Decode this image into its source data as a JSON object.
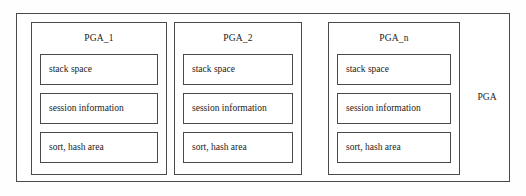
{
  "diagram": {
    "title": "PGA",
    "outer_label": "PGA",
    "panels": [
      {
        "id": "pga-1",
        "title": "PGA_1",
        "regions": [
          {
            "label": "stack space"
          },
          {
            "label": "session information"
          },
          {
            "label": "sort, hash area"
          }
        ]
      },
      {
        "id": "pga-2",
        "title": "PGA_2",
        "regions": [
          {
            "label": "stack space"
          },
          {
            "label": "session information"
          },
          {
            "label": "sort, hash area"
          }
        ]
      },
      {
        "id": "pga-n",
        "title": "PGA_n",
        "regions": [
          {
            "label": "stack space"
          },
          {
            "label": "session information"
          },
          {
            "label": "sort, hash area"
          }
        ]
      }
    ],
    "colors": {
      "background": "#fefefe",
      "box_fill": "#ffffff",
      "stroke": "#4a4a4a",
      "text": "#1a1a1a"
    }
  }
}
